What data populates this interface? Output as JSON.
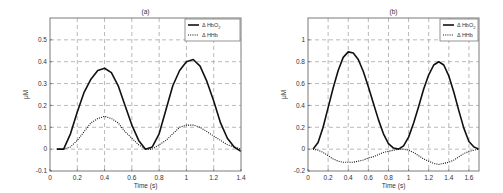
{
  "chart_data": [
    {
      "type": "line",
      "title": "(a)",
      "xlabel": "Time (s)",
      "ylabel": "μM",
      "xlim": [
        0,
        1.4
      ],
      "ylim": [
        -0.1,
        0.6
      ],
      "xticks": [
        0,
        0.2,
        0.4,
        0.6,
        0.8,
        1,
        1.2,
        1.4
      ],
      "xtick_labels": [
        "0",
        "0.2",
        "0.4",
        "0.6",
        "0.8",
        "1",
        "1.2",
        "1.4"
      ],
      "yticks": [
        -0.1,
        0,
        0.1,
        0.2,
        0.3,
        0.4,
        0.5
      ],
      "ytick_labels": [
        "-0.1",
        "0",
        "0.1",
        "0.2",
        "0.3",
        "0.4",
        "0.5"
      ],
      "grid": true,
      "legend_position": "top-right",
      "series": [
        {
          "name": "Δ HbO2",
          "style": "solid",
          "x": [
            0.05,
            0.1,
            0.15,
            0.2,
            0.25,
            0.3,
            0.35,
            0.4,
            0.45,
            0.5,
            0.55,
            0.6,
            0.65,
            0.7,
            0.75,
            0.8,
            0.85,
            0.9,
            0.95,
            1.0,
            1.05,
            1.1,
            1.15,
            1.2,
            1.25,
            1.3,
            1.35,
            1.4
          ],
          "values": [
            0.0,
            0.0,
            0.07,
            0.17,
            0.26,
            0.32,
            0.36,
            0.37,
            0.35,
            0.29,
            0.2,
            0.11,
            0.04,
            0.0,
            0.01,
            0.07,
            0.18,
            0.29,
            0.36,
            0.4,
            0.41,
            0.38,
            0.31,
            0.22,
            0.12,
            0.05,
            0.01,
            -0.01
          ]
        },
        {
          "name": "Δ HHb",
          "style": "dotted",
          "x": [
            0.05,
            0.1,
            0.15,
            0.2,
            0.25,
            0.3,
            0.35,
            0.4,
            0.45,
            0.5,
            0.55,
            0.6,
            0.65,
            0.7,
            0.75,
            0.8,
            0.85,
            0.9,
            0.95,
            1.0,
            1.05,
            1.1,
            1.15,
            1.2,
            1.25,
            1.3,
            1.35,
            1.4
          ],
          "values": [
            0.0,
            0.0,
            0.01,
            0.04,
            0.08,
            0.12,
            0.14,
            0.15,
            0.14,
            0.12,
            0.08,
            0.05,
            0.02,
            0.0,
            0.0,
            0.02,
            0.04,
            0.07,
            0.1,
            0.11,
            0.11,
            0.1,
            0.08,
            0.06,
            0.04,
            0.02,
            0.01,
            0.0
          ]
        }
      ]
    },
    {
      "type": "line",
      "title": "(b)",
      "xlabel": "Time (s)",
      "ylabel": "μM",
      "xlim": [
        0,
        1.7
      ],
      "ylim": [
        -0.2,
        1.2
      ],
      "xticks": [
        0,
        0.2,
        0.4,
        0.6,
        0.8,
        1,
        1.2,
        1.4,
        1.6
      ],
      "xtick_labels": [
        "0",
        "0.2",
        "0.4",
        "0.6",
        "0.8",
        "1",
        "1.2",
        "1.4",
        "1.6"
      ],
      "yticks": [
        -0.2,
        0,
        0.2,
        0.4,
        0.6,
        0.8,
        1
      ],
      "ytick_labels": [
        "-0.2",
        "0",
        "0.2",
        "0.4",
        "0.6",
        "0.8",
        "1"
      ],
      "grid": true,
      "legend_position": "top-right",
      "series": [
        {
          "name": "Δ HbO2",
          "style": "solid",
          "x": [
            0.05,
            0.1,
            0.15,
            0.2,
            0.25,
            0.3,
            0.35,
            0.4,
            0.45,
            0.5,
            0.55,
            0.6,
            0.65,
            0.7,
            0.75,
            0.8,
            0.85,
            0.9,
            0.95,
            1.0,
            1.05,
            1.1,
            1.15,
            1.2,
            1.25,
            1.3,
            1.35,
            1.4,
            1.45,
            1.5,
            1.55,
            1.6,
            1.65,
            1.7
          ],
          "values": [
            0.0,
            0.06,
            0.2,
            0.38,
            0.56,
            0.72,
            0.84,
            0.89,
            0.88,
            0.82,
            0.71,
            0.57,
            0.42,
            0.27,
            0.14,
            0.05,
            0.01,
            0.0,
            0.03,
            0.11,
            0.24,
            0.39,
            0.55,
            0.68,
            0.77,
            0.8,
            0.77,
            0.67,
            0.52,
            0.35,
            0.19,
            0.07,
            0.02,
            0.0
          ]
        },
        {
          "name": "Δ HHb",
          "style": "dotted",
          "x": [
            0.05,
            0.1,
            0.15,
            0.2,
            0.25,
            0.3,
            0.35,
            0.4,
            0.45,
            0.5,
            0.55,
            0.6,
            0.65,
            0.7,
            0.75,
            0.8,
            0.85,
            0.9,
            0.95,
            1.0,
            1.05,
            1.1,
            1.15,
            1.2,
            1.25,
            1.3,
            1.35,
            1.4,
            1.45,
            1.5,
            1.55,
            1.6,
            1.65,
            1.7
          ],
          "values": [
            0.0,
            -0.01,
            -0.03,
            -0.06,
            -0.09,
            -0.11,
            -0.12,
            -0.12,
            -0.12,
            -0.11,
            -0.1,
            -0.08,
            -0.07,
            -0.05,
            -0.03,
            -0.02,
            -0.01,
            0.0,
            0.0,
            -0.01,
            -0.03,
            -0.06,
            -0.09,
            -0.11,
            -0.13,
            -0.14,
            -0.13,
            -0.12,
            -0.1,
            -0.07,
            -0.04,
            -0.02,
            -0.01,
            0.0
          ]
        }
      ]
    }
  ]
}
